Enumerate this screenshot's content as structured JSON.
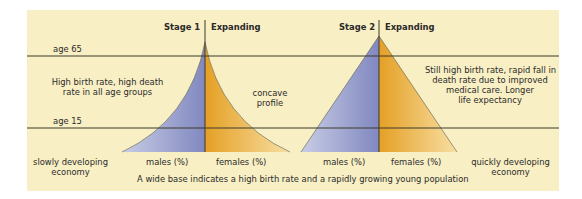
{
  "colors": {
    "panel_bg": "#f8efc4",
    "males_fill": "#9ea5d3",
    "females_fill": "#eab44a",
    "line": "#3a3a2a"
  },
  "age_lines": {
    "upper": "age 65",
    "lower": "age 15"
  },
  "stage1": {
    "stage_label": "Stage 1",
    "type_label": "Expanding",
    "left_note_line1": "High birth rate, high death",
    "left_note_line2": "rate in all age groups",
    "profile_line1": "concave",
    "profile_line2": "profile",
    "males_label": "males (%)",
    "females_label": "females (%)",
    "economy_line1": "slowly developing",
    "economy_line2": "economy"
  },
  "stage2": {
    "stage_label": "Stage 2",
    "type_label": "Expanding",
    "note_line1": "Still high birth rate, rapid fall in",
    "note_line2": "death rate due to improved",
    "note_line3": "medical care. Longer",
    "note_line4": "life expectancy",
    "males_label": "males (%)",
    "females_label": "females (%)",
    "economy_line1": "quickly developing",
    "economy_line2": "economy"
  },
  "caption": "A wide base indicates a high birth rate and a rapidly growing young population"
}
